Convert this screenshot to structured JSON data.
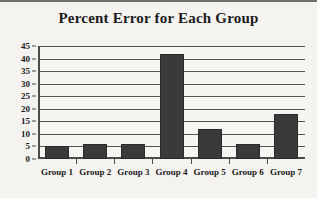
{
  "chart_data": {
    "type": "bar",
    "title": "Percent Error for Each Group",
    "xlabel": "",
    "ylabel": "",
    "categories": [
      "Group 1",
      "Group 2",
      "Group 3",
      "Group 4",
      "Group 5",
      "Group 6",
      "Group 7"
    ],
    "values": [
      5,
      6,
      6,
      42,
      12,
      6,
      18
    ],
    "ylim": [
      0,
      45
    ],
    "ytick_labels": [
      "0",
      "5",
      "10",
      "15",
      "20",
      "25",
      "30",
      "35",
      "40",
      "45"
    ],
    "ytick_values": [
      0,
      5,
      10,
      15,
      20,
      25,
      30,
      35,
      40,
      45
    ],
    "ytick_step": 5,
    "grid": true,
    "grid_axis": "y",
    "legend": false,
    "legend_position": "none",
    "bar_color": "#3a3a3a",
    "background_color": "#f4f3f0",
    "axis_color": "#4a4a48",
    "text_color": "#1b1b1b"
  }
}
